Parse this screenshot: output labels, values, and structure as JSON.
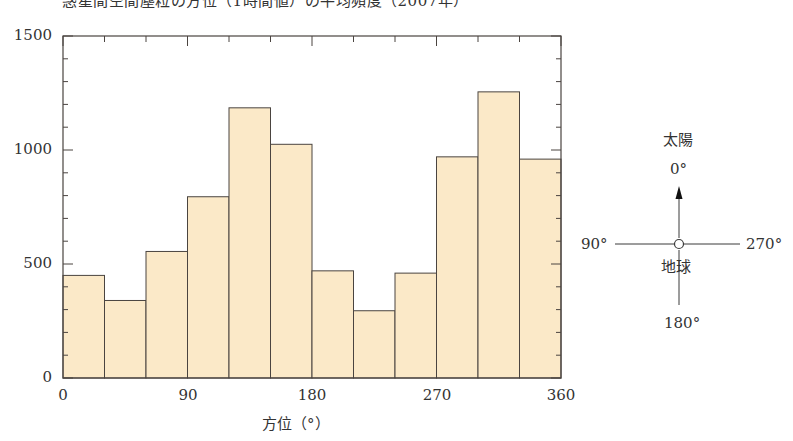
{
  "chart_data": {
    "type": "bar",
    "title": "惑星間空間塵粒の方位（1時間値）の平均頻度（2007年）",
    "xlabel": "方位（°）",
    "ylabel": "",
    "xlim": [
      0,
      360
    ],
    "ylim": [
      0,
      1500
    ],
    "x_ticks": [
      "0",
      "90",
      "180",
      "270",
      "360"
    ],
    "y_ticks": [
      "0",
      "500",
      "1000",
      "1500"
    ],
    "bin_width": 30,
    "bins": [
      {
        "from": 0,
        "to": 30,
        "value": 450
      },
      {
        "from": 30,
        "to": 60,
        "value": 340
      },
      {
        "from": 60,
        "to": 90,
        "value": 555
      },
      {
        "from": 90,
        "to": 120,
        "value": 795
      },
      {
        "from": 120,
        "to": 150,
        "value": 1185
      },
      {
        "from": 150,
        "to": 180,
        "value": 1025
      },
      {
        "from": 180,
        "to": 210,
        "value": 470
      },
      {
        "from": 210,
        "to": 240,
        "value": 295
      },
      {
        "from": 240,
        "to": 270,
        "value": 460
      },
      {
        "from": 270,
        "to": 300,
        "value": 970
      },
      {
        "from": 300,
        "to": 330,
        "value": 1255
      },
      {
        "from": 330,
        "to": 360,
        "value": 960
      }
    ],
    "categories": [
      "0-30",
      "30-60",
      "60-90",
      "90-120",
      "120-150",
      "150-180",
      "180-210",
      "210-240",
      "240-270",
      "270-300",
      "300-330",
      "330-360"
    ],
    "values": [
      450,
      340,
      555,
      795,
      1185,
      1025,
      470,
      295,
      460,
      970,
      1255,
      960
    ],
    "bar_color": "#fbe9c8",
    "bar_edge_color": "#4a4440",
    "grid": false,
    "legend": null
  },
  "chart": {
    "title": "惑星間空間塵粒の方位（1時間値）の平均頻度（2007年）",
    "xlabel": "方位（°）",
    "y_ticks": [
      "1500",
      "1000",
      "500",
      "0"
    ],
    "x_ticks": [
      "0",
      "90",
      "180",
      "270",
      "360"
    ]
  },
  "diagram": {
    "sun_label": "太陽",
    "top_angle": "0°",
    "left_angle": "90°",
    "right_angle": "270°",
    "bottom_angle": "180°",
    "earth_label": "地球"
  }
}
